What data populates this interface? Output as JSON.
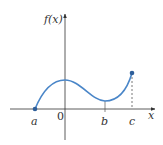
{
  "diagram": {
    "y_axis_label": "f(x)",
    "x_axis_label": "x",
    "origin_label": "0",
    "points": [
      {
        "label": "a",
        "role": "left endpoint (filled dot on x-axis)"
      },
      {
        "label": "b",
        "role": "local minimum (tick mark)"
      },
      {
        "label": "c",
        "role": "right endpoint (filled dot, dashed drop line)"
      }
    ],
    "colors": {
      "curve": "#4a86c8",
      "axis": "#333333",
      "dashed": "#555555"
    }
  },
  "labels": {
    "a": "a",
    "b": "b",
    "c": "c",
    "zero": "0",
    "x": "x",
    "fx": "f(x)"
  }
}
